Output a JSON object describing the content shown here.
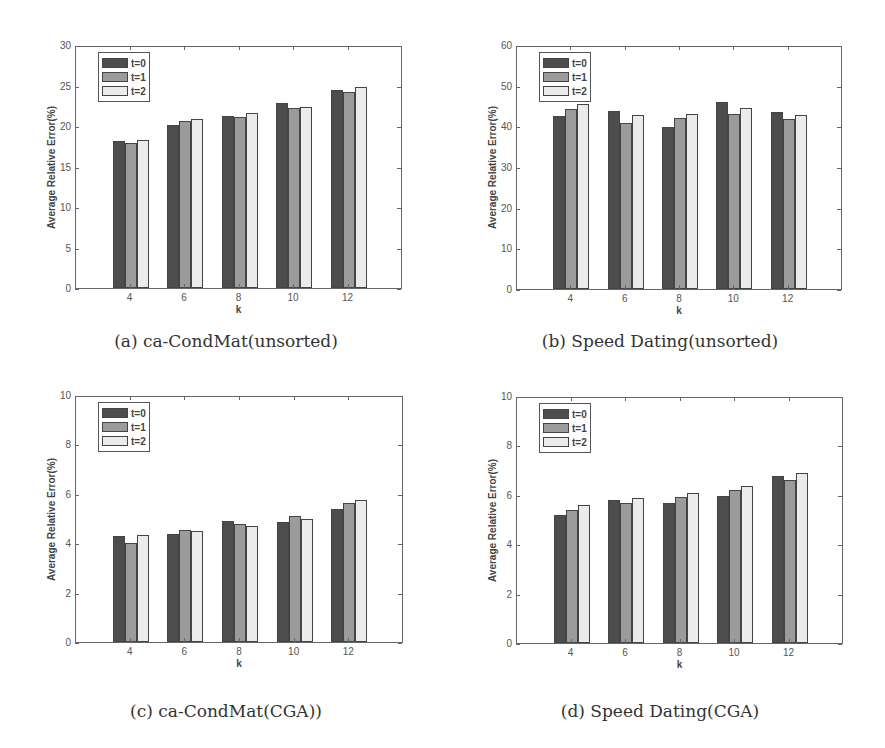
{
  "colors": {
    "t0": "#4d4d4d",
    "t1": "#9b9b9b",
    "t2": "#ebebeb"
  },
  "chart_data": [
    {
      "id": "a",
      "type": "bar",
      "title": "(a) ca-CondMat(unsorted)",
      "xlabel": "k",
      "ylabel": "Average Relative Error(%)",
      "categories": [
        "4",
        "6",
        "8",
        "10",
        "12"
      ],
      "ylim": [
        0,
        30
      ],
      "yticks": [
        0,
        5,
        10,
        15,
        20,
        25,
        30
      ],
      "xlim": [
        2,
        14
      ],
      "legend": [
        "t=0",
        "t=1",
        "t=2"
      ],
      "legend_position": "upper left",
      "grid": false,
      "series": [
        {
          "name": "t=0",
          "values": [
            18.2,
            20.1,
            21.2,
            22.9,
            24.4
          ]
        },
        {
          "name": "t=1",
          "values": [
            17.9,
            20.6,
            21.1,
            22.2,
            24.2
          ]
        },
        {
          "name": "t=2",
          "values": [
            18.3,
            20.9,
            21.6,
            22.3,
            24.8
          ]
        }
      ]
    },
    {
      "id": "b",
      "type": "bar",
      "title": "(b) Speed Dating(unsorted)",
      "xlabel": "k",
      "ylabel": "Average Relative Error(%)",
      "categories": [
        "4",
        "6",
        "8",
        "10",
        "12"
      ],
      "ylim": [
        0,
        60
      ],
      "yticks": [
        0,
        10,
        20,
        30,
        40,
        50,
        60
      ],
      "xlim": [
        2,
        14
      ],
      "legend": [
        "t=0",
        "t=1",
        "t=2"
      ],
      "legend_position": "upper left",
      "grid": false,
      "series": [
        {
          "name": "t=0",
          "values": [
            42.5,
            43.8,
            39.9,
            45.9,
            43.5
          ]
        },
        {
          "name": "t=1",
          "values": [
            44.3,
            40.9,
            42.1,
            43.1,
            41.7
          ]
        },
        {
          "name": "t=2",
          "values": [
            45.6,
            42.9,
            43.1,
            44.4,
            42.8
          ]
        }
      ]
    },
    {
      "id": "c",
      "type": "bar",
      "title": "(c) ca-CondMat(CGA))",
      "xlabel": "k",
      "ylabel": "Average Relative Error(%)",
      "categories": [
        "4",
        "6",
        "8",
        "10",
        "12"
      ],
      "ylim": [
        0,
        10
      ],
      "yticks": [
        0,
        2,
        4,
        6,
        8,
        10
      ],
      "xlim": [
        2,
        14
      ],
      "legend": [
        "t=0",
        "t=1",
        "t=2"
      ],
      "legend_position": "upper left",
      "grid": false,
      "series": [
        {
          "name": "t=0",
          "values": [
            4.3,
            4.39,
            4.91,
            4.85,
            5.39
          ]
        },
        {
          "name": "t=1",
          "values": [
            4.01,
            4.55,
            4.76,
            5.12,
            5.64
          ]
        },
        {
          "name": "t=2",
          "values": [
            4.35,
            4.49,
            4.69,
            4.99,
            5.76
          ]
        }
      ]
    },
    {
      "id": "d",
      "type": "bar",
      "title": "(d) Speed Dating(CGA)",
      "xlabel": "k",
      "ylabel": "Average Relative Error(%)",
      "categories": [
        "4",
        "6",
        "8",
        "10",
        "12"
      ],
      "ylim": [
        0,
        10
      ],
      "yticks": [
        0,
        2,
        4,
        6,
        8,
        10
      ],
      "xlim": [
        2,
        14
      ],
      "legend": [
        "t=0",
        "t=1",
        "t=2"
      ],
      "legend_position": "upper left",
      "grid": false,
      "series": [
        {
          "name": "t=0",
          "values": [
            5.19,
            5.8,
            5.66,
            5.96,
            6.77
          ]
        },
        {
          "name": "t=1",
          "values": [
            5.39,
            5.65,
            5.93,
            6.18,
            6.62
          ]
        },
        {
          "name": "t=2",
          "values": [
            5.57,
            5.88,
            6.08,
            6.36,
            6.88
          ]
        }
      ]
    }
  ]
}
